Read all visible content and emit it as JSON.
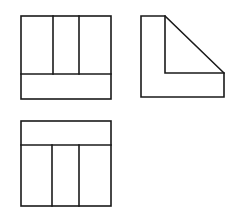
{
  "diagram": {
    "type": "orthographic-projection",
    "stroke_color": "#1a1a1a",
    "background": "#ffffff",
    "views": [
      {
        "name": "front-view",
        "outline": {
          "x": 21,
          "y": 16,
          "w": 90,
          "h": 83
        },
        "horizontal_divider_y": 74,
        "vertical_dividers_x": [
          53,
          79
        ],
        "dividers_span": "top"
      },
      {
        "name": "side-view",
        "points": "141,16 165,16 224,73 224,97 141,97",
        "inner_path": "165,16 165,73 224,73"
      },
      {
        "name": "top-view",
        "outline": {
          "x": 21,
          "y": 121,
          "w": 90,
          "h": 85
        },
        "horizontal_divider_y": 145,
        "vertical_dividers_x": [
          52,
          79
        ],
        "dividers_span": "bottom"
      }
    ]
  }
}
